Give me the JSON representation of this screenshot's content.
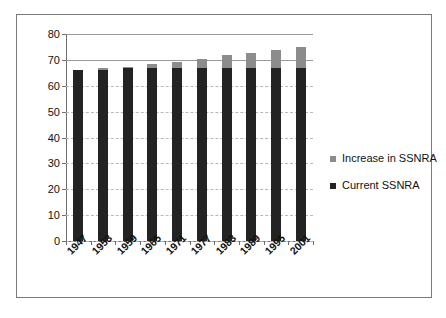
{
  "chart_data": {
    "type": "bar",
    "stacked": true,
    "title": "",
    "subtitle": "",
    "xlabel": "",
    "ylabel": "",
    "ylim": [
      0,
      80
    ],
    "ytick_step": 10,
    "yticks": [
      80,
      70,
      60,
      50,
      40,
      30,
      20,
      10,
      0
    ],
    "grid": true,
    "legend_position": "right",
    "categories": [
      "1947",
      "1953",
      "1959",
      "1965",
      "1971",
      "1977",
      "1983",
      "1989",
      "1995",
      "2001"
    ],
    "series": [
      {
        "name": "Current SSNRA",
        "color": "#232323",
        "values": [
          66.0,
          66.2,
          66.7,
          67.0,
          67.0,
          67.0,
          67.0,
          67.0,
          67.0,
          67.0
        ]
      },
      {
        "name": "Increase in SSNRA",
        "color": "#8c8c8c",
        "values": [
          0.0,
          0.5,
          0.4,
          1.5,
          2.3,
          3.2,
          4.7,
          5.5,
          6.8,
          7.8
        ]
      }
    ],
    "totals": [
      66.0,
      66.7,
      67.1,
      68.5,
      69.3,
      70.2,
      71.7,
      72.5,
      73.8,
      74.8
    ]
  },
  "axis": {
    "y_labels": [
      "80",
      "70",
      "60",
      "50",
      "40",
      "30",
      "20",
      "10",
      "0"
    ],
    "x_labels": [
      "1947",
      "1953",
      "1959",
      "1965",
      "1971",
      "1977",
      "1983",
      "1989",
      "1995",
      "2001"
    ]
  },
  "legend": {
    "items": [
      {
        "label": "Increase in SSNRA",
        "color": "#8c8c8c"
      },
      {
        "label": "Current SSNRA",
        "color": "#232323"
      }
    ]
  },
  "colors": {
    "series_increase": "#8c8c8c",
    "series_current": "#232323",
    "gridline": "#b9b9b9",
    "axis": "#6f6f6f",
    "frame": "#7b7b7b",
    "background": "#ffffff",
    "text": "#111111"
  }
}
